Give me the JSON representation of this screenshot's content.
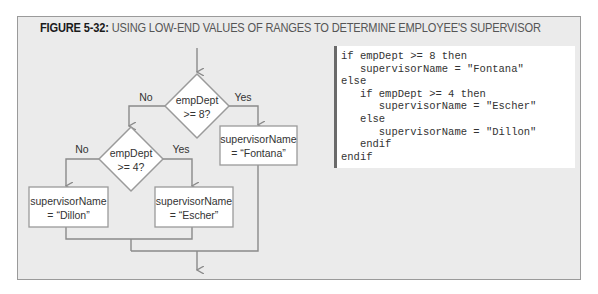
{
  "figure": {
    "label": "FIGURE 5-32:",
    "title": "USING LOW-END VALUES OF RANGES TO DETERMINE EMPLOYEE'S SUPERVISOR"
  },
  "flowchart": {
    "decision1": {
      "line1": "empDept",
      "line2": ">= 8?",
      "no_label": "No",
      "yes_label": "Yes"
    },
    "decision2": {
      "line1": "empDept",
      "line2": ">= 4?",
      "no_label": "No",
      "yes_label": "Yes"
    },
    "process_fontana": {
      "line1": "supervisorName",
      "line2": "= “Fontana”"
    },
    "process_dillon": {
      "line1": "supervisorName",
      "line2": "= “Dillon”"
    },
    "process_escher": {
      "line1": "supervisorName",
      "line2": "= “Escher”"
    }
  },
  "pseudocode": {
    "lines": [
      "if empDept >= 8 then",
      "   supervisorName = \"Fontana\"",
      "else",
      "   if empDept >= 4 then",
      "      supervisorName = \"Escher\"",
      "   else",
      "      supervisorName = \"Dillon\"",
      "   endif",
      "endif"
    ]
  },
  "colors": {
    "frame_bg": "#ebebeb",
    "line": "#8a8a8a",
    "shape_border": "#9a9a9a",
    "code_border": "#6a6a6a"
  }
}
